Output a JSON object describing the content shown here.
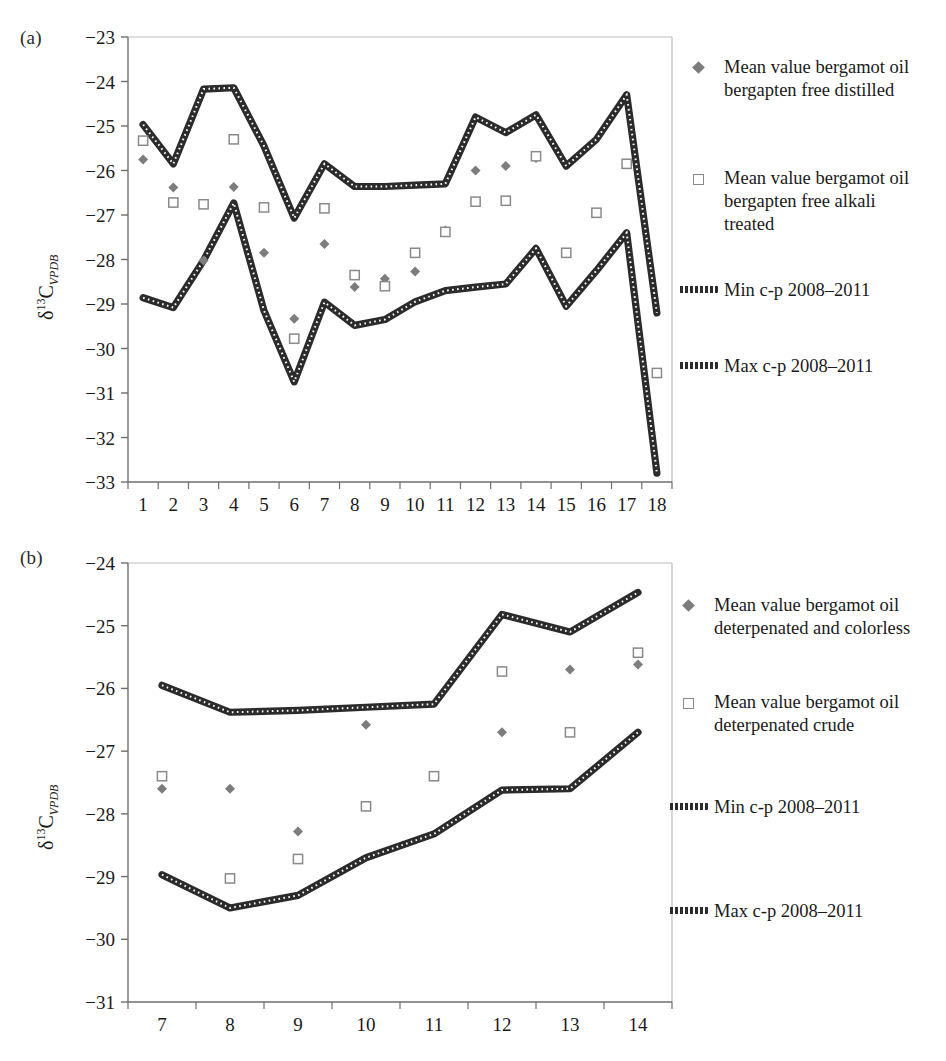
{
  "figure": {
    "panels": [
      {
        "letter": "(a)",
        "ylabel_prefix": "δ",
        "ylabel_sup": "13",
        "ylabel_mid": "C",
        "ylabel_sub": "VPDB",
        "legend": [
          {
            "key": "diamond-marker",
            "label": "Mean value bergamot oil\nbergapten free distilled"
          },
          {
            "key": "square-marker",
            "label": "Mean value bergamot oil\nbergapten free alkali\ntreated"
          },
          {
            "key": "dashed-line",
            "label": "Min c-p 2008–2011"
          },
          {
            "key": "dashed-line",
            "label": "Max c-p 2008–2011"
          }
        ]
      },
      {
        "letter": "(b)",
        "ylabel_prefix": "δ",
        "ylabel_sup": "13",
        "ylabel_mid": "C",
        "ylabel_sub": "VPDB",
        "legend": [
          {
            "key": "diamond-marker",
            "label": "Mean value bergamot oil\ndeterpenated and colorless"
          },
          {
            "key": "square-marker",
            "label": "Mean value bergamot oil\ndeterpenated crude"
          },
          {
            "key": "dashed-line",
            "label": "Min c-p 2008–2011"
          },
          {
            "key": "dashed-line",
            "label": "Max c-p 2008–2011"
          }
        ]
      }
    ],
    "colors": {
      "marker_diamond": "#7d7d7d",
      "marker_square_border": "#8a8a8a",
      "line": "#2b2b2b",
      "axis": "#808080",
      "text": "#1a1a1a"
    }
  },
  "chart_data": [
    {
      "type": "line",
      "panel": "(a)",
      "title": "",
      "xlabel": "",
      "ylabel": "δ13C_VPDB",
      "categories": [
        1,
        2,
        3,
        4,
        5,
        6,
        7,
        8,
        9,
        10,
        11,
        12,
        13,
        14,
        15,
        16,
        17,
        18
      ],
      "xtick_labels": [
        "1",
        "2",
        "3",
        "4",
        "5",
        "6",
        "7",
        "8",
        "9",
        "10",
        "11",
        "12",
        "13",
        "14",
        "15",
        "16",
        "17",
        "18"
      ],
      "ylim": [
        -33,
        -23
      ],
      "ytick_labels": [
        "-23",
        "-24",
        "-25",
        "-26",
        "-27",
        "-28",
        "-29",
        "-30",
        "-31",
        "-32",
        "-33"
      ],
      "yticks": [
        -23,
        -24,
        -25,
        -26,
        -27,
        -28,
        -29,
        -30,
        -31,
        -32,
        -33
      ],
      "grid": false,
      "legend_position": "right",
      "series": [
        {
          "name": "Max c-p 2008–2011",
          "style": "dashed-line",
          "values": [
            -24.97,
            -25.85,
            -24.17,
            -24.14,
            -25.45,
            -27.07,
            -25.85,
            -26.36,
            -26.36,
            -26.33,
            -26.3,
            -24.8,
            -25.15,
            -24.75,
            -25.9,
            -25.3,
            -24.3,
            -29.2
          ]
        },
        {
          "name": "Min c-p 2008–2011",
          "style": "dashed-line",
          "values": [
            -28.86,
            -29.08,
            -28.02,
            -26.73,
            -29.15,
            -30.75,
            -28.96,
            -29.48,
            -29.35,
            -28.95,
            -28.7,
            -28.62,
            -28.55,
            -27.75,
            -29.05,
            -28.25,
            -27.4,
            -32.8
          ]
        },
        {
          "name": "Mean value bergamot oil bergapten free distilled",
          "style": "diamond-marker",
          "values": [
            -25.75,
            -26.38,
            -28.02,
            -26.37,
            -27.85,
            -29.33,
            -27.65,
            -28.62,
            -28.43,
            -28.27,
            -27.35,
            -26.0,
            -25.9,
            -25.72,
            null,
            null,
            null,
            null
          ]
        },
        {
          "name": "Mean value bergamot oil bergapten free alkali treated",
          "style": "square-marker",
          "values": [
            -25.33,
            -26.72,
            -26.76,
            -25.3,
            -26.83,
            -29.78,
            -26.85,
            -28.35,
            -28.6,
            -27.85,
            -27.38,
            -26.7,
            -26.68,
            -25.68,
            -27.85,
            -26.95,
            -25.85,
            -30.55
          ]
        }
      ]
    },
    {
      "type": "line",
      "panel": "(b)",
      "title": "",
      "xlabel": "",
      "ylabel": "δ13C_VPDB",
      "categories": [
        7,
        8,
        9,
        10,
        11,
        12,
        13,
        14
      ],
      "xtick_labels": [
        "7",
        "8",
        "9",
        "10",
        "11",
        "12",
        "13",
        "14"
      ],
      "ylim": [
        -31,
        -24
      ],
      "ytick_labels": [
        "-24",
        "-25",
        "-26",
        "-27",
        "-28",
        "-29",
        "-30",
        "-31"
      ],
      "yticks": [
        -24,
        -25,
        -26,
        -27,
        -28,
        -29,
        -30,
        -31
      ],
      "grid": false,
      "legend_position": "right",
      "series": [
        {
          "name": "Max c-p 2008–2011",
          "style": "dashed-line",
          "values": [
            -25.95,
            -26.38,
            -26.35,
            -26.3,
            -26.25,
            -24.82,
            -25.1,
            -24.47
          ]
        },
        {
          "name": "Min c-p 2008–2011",
          "style": "dashed-line",
          "values": [
            -28.97,
            -29.5,
            -29.3,
            -28.7,
            -28.32,
            -27.62,
            -27.6,
            -26.7
          ]
        },
        {
          "name": "Mean value bergamot oil deterpenated and colorless",
          "style": "diamond-marker",
          "values": [
            -27.6,
            -27.6,
            -28.28,
            -26.58,
            -27.4,
            -26.7,
            -25.7,
            -25.62
          ]
        },
        {
          "name": "Mean value bergamot oil deterpenated crude",
          "style": "square-marker",
          "values": [
            -27.4,
            -29.03,
            -28.72,
            -27.88,
            -27.4,
            -25.73,
            -26.7,
            -25.43
          ]
        }
      ]
    }
  ]
}
